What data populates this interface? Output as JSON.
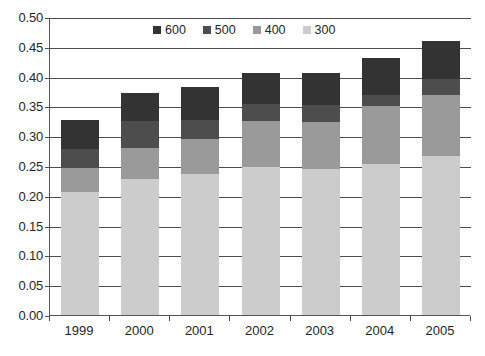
{
  "chart_data": {
    "type": "bar",
    "subtype": "stacked-bar",
    "title": "",
    "subtitle": "",
    "xlabel": "",
    "ylabel": "",
    "categories": [
      "1999",
      "2000",
      "2001",
      "2002",
      "2003",
      "2004",
      "2005"
    ],
    "series": [
      {
        "name": "300",
        "color": "#cccccc",
        "values": [
          0.206,
          0.228,
          0.236,
          0.248,
          0.245,
          0.253,
          0.267
        ]
      },
      {
        "name": "400",
        "color": "#9a9a9a",
        "values": [
          0.04,
          0.053,
          0.06,
          0.077,
          0.079,
          0.097,
          0.102
        ]
      },
      {
        "name": "500",
        "color": "#4d4d4d",
        "values": [
          0.032,
          0.045,
          0.032,
          0.029,
          0.028,
          0.02,
          0.027
        ]
      },
      {
        "name": "600",
        "color": "#333333",
        "values": [
          0.05,
          0.047,
          0.054,
          0.052,
          0.054,
          0.062,
          0.064
        ]
      }
    ],
    "stack_order_bottom_to_top": [
      "300",
      "400",
      "500",
      "600"
    ],
    "totals": [
      0.328,
      0.373,
      0.382,
      0.406,
      0.406,
      0.432,
      0.46
    ],
    "ylim": [
      0.0,
      0.5
    ],
    "ytick_step": 0.05,
    "ytick_labels": [
      "0.50",
      "0.45",
      "0.40",
      "0.35",
      "0.30",
      "0.25",
      "0.20",
      "0.15",
      "0.10",
      "0.05",
      "0.00"
    ],
    "ytick_values": [
      0.5,
      0.45,
      0.4,
      0.35,
      0.3,
      0.25,
      0.2,
      0.15,
      0.1,
      0.05,
      0.0
    ],
    "grid": {
      "horizontal": true,
      "vertical": false
    },
    "legend": {
      "position": "top-center",
      "entries": [
        {
          "label": "600",
          "color": "#333333"
        },
        {
          "label": "500",
          "color": "#4d4d4d"
        },
        {
          "label": "400",
          "color": "#9a9a9a"
        },
        {
          "label": "300",
          "color": "#cccccc"
        }
      ]
    },
    "axis_color": "#4d4d4d",
    "background": "#ffffff"
  }
}
